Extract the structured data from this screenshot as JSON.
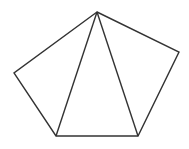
{
  "diagram": {
    "type": "pentagon-with-diagonals",
    "stroke_color": "#333333",
    "background": "#ffffff",
    "vertices": {
      "top": [
        97,
        12
      ],
      "right": [
        179,
        52
      ],
      "bottom_right": [
        138,
        136
      ],
      "bottom_left": [
        56,
        136
      ],
      "left": [
        14,
        73
      ]
    },
    "edges": [
      {
        "name": "top-right",
        "from": "top",
        "to": "right"
      },
      {
        "name": "right-bottom-right",
        "from": "right",
        "to": "bottom_right"
      },
      {
        "name": "bottom",
        "from": "bottom_right",
        "to": "bottom_left"
      },
      {
        "name": "bottom-left-left",
        "from": "bottom_left",
        "to": "left"
      },
      {
        "name": "left-top",
        "from": "left",
        "to": "top"
      }
    ],
    "diagonals": [
      {
        "name": "top-to-bottom-left",
        "from": "top",
        "to": "bottom_left"
      },
      {
        "name": "top-to-bottom-right",
        "from": "top",
        "to": "bottom_right"
      }
    ]
  }
}
